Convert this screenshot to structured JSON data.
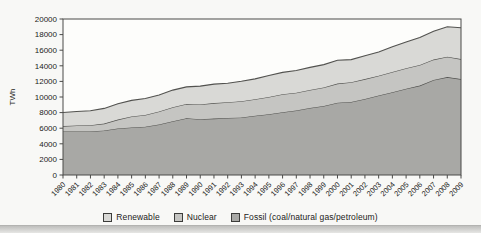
{
  "chart_data": {
    "type": "area",
    "stacked": true,
    "title": "",
    "xlabel": "",
    "ylabel": "TWh",
    "ylim": [
      0,
      20000
    ],
    "yticks": [
      0,
      2000,
      4000,
      6000,
      8000,
      10000,
      12000,
      14000,
      16000,
      18000,
      20000
    ],
    "grid": false,
    "legend_position": "bottom",
    "x": [
      "1980",
      "1981",
      "1982",
      "1983",
      "1984",
      "1985",
      "1986",
      "1987",
      "1988",
      "1989",
      "1990",
      "1991",
      "1992",
      "1993",
      "1994",
      "1995",
      "1996",
      "1997",
      "1998",
      "1999",
      "2000",
      "2001",
      "2002",
      "2003",
      "2004",
      "2005",
      "2006",
      "2007",
      "2008",
      "2009"
    ],
    "series": [
      {
        "name": "Renewable",
        "color": "#d9d9d6",
        "values": [
          1745,
          1795,
          1843,
          1941,
          2030,
          2057,
          2095,
          2114,
          2189,
          2186,
          2352,
          2428,
          2429,
          2561,
          2611,
          2755,
          2812,
          2852,
          2884,
          2921,
          2983,
          2910,
          2991,
          3048,
          3222,
          3365,
          3511,
          3640,
          3847,
          4012
        ]
      },
      {
        "name": "Nuclear",
        "color": "#c5c5c2",
        "values": [
          684,
          769,
          805,
          894,
          1129,
          1426,
          1518,
          1653,
          1795,
          1843,
          1909,
          1994,
          2011,
          2080,
          2122,
          2210,
          2290,
          2266,
          2312,
          2393,
          2450,
          2517,
          2545,
          2518,
          2616,
          2626,
          2660,
          2597,
          2601,
          2558
        ]
      },
      {
        "name": "Fossil (coal/natural gas/petroleum)",
        "color": "#a8a8a5",
        "values": [
          5589,
          5577,
          5577,
          5701,
          5975,
          6084,
          6192,
          6490,
          6900,
          7269,
          7136,
          7228,
          7322,
          7372,
          7584,
          7789,
          8055,
          8283,
          8600,
          8841,
          9267,
          9374,
          9746,
          10197,
          10607,
          11064,
          11460,
          12193,
          12550,
          12300
        ]
      }
    ],
    "stack_order_bottom_to_top": [
      "Fossil (coal/natural gas/petroleum)",
      "Nuclear",
      "Renewable"
    ],
    "colors": {
      "plot_bg": "#fdfdfb",
      "axis": "#4a4a48",
      "boundary_line": "#52524f",
      "tick_text": "#1c1c1a"
    }
  }
}
